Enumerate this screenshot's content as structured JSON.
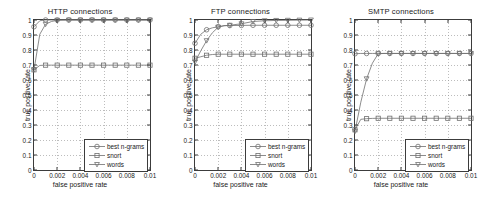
{
  "figure": {
    "width": 481,
    "height": 202,
    "background": "#ffffff",
    "axis_color": "#3c3c3c",
    "grid_color": "#9a9a9a",
    "series_color": "#6e6e6e"
  },
  "common": {
    "xlabel": "false positive rate",
    "ylabel": "true positive rate",
    "xticks": [
      "0",
      "0.002",
      "0.004",
      "0.006",
      "0.008",
      "0.01"
    ],
    "xtick_values": [
      0,
      0.002,
      0.004,
      0.006,
      0.008,
      0.01
    ],
    "yticks": [
      "0",
      "0.1",
      "0.2",
      "0.3",
      "0.4",
      "0.5",
      "0.6",
      "0.7",
      "0.8",
      "0.9",
      "1"
    ],
    "ytick_values": [
      0,
      0.1,
      0.2,
      0.3,
      0.4,
      0.5,
      0.6,
      0.7,
      0.8,
      0.9,
      1
    ],
    "xlim": [
      0,
      0.01
    ],
    "ylim": [
      0,
      1
    ],
    "grid": true,
    "legend_position": "lower right",
    "legend_labels": [
      "best n-grams",
      "snort",
      "words"
    ],
    "legend_markers": [
      "circle",
      "square",
      "triangle-down"
    ]
  },
  "chart_data": [
    {
      "type": "line",
      "title": "HTTP connections",
      "xlabel": "false positive rate",
      "ylabel": "true positive rate",
      "xlim": [
        0,
        0.01
      ],
      "ylim": [
        0,
        1
      ],
      "grid": true,
      "x": [
        0,
        0.0005,
        0.001,
        0.0015,
        0.002,
        0.0025,
        0.003,
        0.004,
        0.005,
        0.006,
        0.007,
        0.008,
        0.009,
        0.01
      ],
      "series": [
        {
          "name": "best n-grams",
          "marker": "circle",
          "values": [
            0.955,
            0.995,
            1.0,
            1.0,
            1.0,
            1.0,
            1.0,
            1.0,
            1.0,
            1.0,
            1.0,
            1.0,
            1.0,
            1.0
          ]
        },
        {
          "name": "snort",
          "marker": "square",
          "values": [
            0.668,
            0.697,
            0.699,
            0.699,
            0.699,
            0.699,
            0.699,
            0.699,
            0.699,
            0.699,
            0.699,
            0.699,
            0.699,
            0.699
          ]
        },
        {
          "name": "words",
          "marker": "triangle-down",
          "values": [
            0.668,
            0.905,
            0.972,
            0.99,
            0.998,
            1.0,
            1.0,
            1.0,
            1.0,
            1.0,
            1.0,
            1.0,
            1.0,
            1.0
          ]
        }
      ]
    },
    {
      "type": "line",
      "title": "FTP connections",
      "xlabel": "false positive rate",
      "ylabel": "true positive rate",
      "xlim": [
        0,
        0.01
      ],
      "ylim": [
        0,
        1
      ],
      "grid": true,
      "x": [
        0,
        0.0005,
        0.001,
        0.0015,
        0.002,
        0.0025,
        0.003,
        0.004,
        0.005,
        0.006,
        0.007,
        0.008,
        0.009,
        0.01
      ],
      "series": [
        {
          "name": "best n-grams",
          "marker": "circle",
          "values": [
            0.845,
            0.905,
            0.935,
            0.948,
            0.955,
            0.962,
            0.963,
            0.964,
            0.965,
            0.965,
            0.965,
            0.965,
            0.965,
            0.965
          ]
        },
        {
          "name": "snort",
          "marker": "square",
          "values": [
            0.745,
            0.755,
            0.765,
            0.77,
            0.772,
            0.772,
            0.772,
            0.772,
            0.772,
            0.772,
            0.772,
            0.772,
            0.772,
            0.772
          ]
        },
        {
          "name": "words",
          "marker": "triangle-down",
          "values": [
            0.72,
            0.795,
            0.862,
            0.915,
            0.952,
            0.962,
            0.965,
            0.975,
            0.99,
            0.995,
            0.997,
            0.998,
            0.999,
            1.0
          ]
        }
      ]
    },
    {
      "type": "line",
      "title": "SMTP connections",
      "xlabel": "false positive rate",
      "ylabel": "true positive rate",
      "xlim": [
        0,
        0.01
      ],
      "ylim": [
        0,
        1
      ],
      "grid": true,
      "x": [
        0,
        0.0005,
        0.001,
        0.0015,
        0.002,
        0.0025,
        0.003,
        0.004,
        0.005,
        0.006,
        0.007,
        0.008,
        0.009,
        0.01
      ],
      "series": [
        {
          "name": "best n-grams",
          "marker": "circle",
          "values": [
            0.775,
            0.777,
            0.777,
            0.777,
            0.777,
            0.777,
            0.777,
            0.777,
            0.777,
            0.777,
            0.777,
            0.777,
            0.777,
            0.777
          ]
        },
        {
          "name": "snort",
          "marker": "square",
          "values": [
            0.268,
            0.338,
            0.342,
            0.344,
            0.345,
            0.345,
            0.345,
            0.345,
            0.345,
            0.345,
            0.345,
            0.345,
            0.345,
            0.345
          ]
        },
        {
          "name": "words",
          "marker": "triangle-down",
          "values": [
            0.258,
            0.452,
            0.608,
            0.712,
            0.775,
            0.777,
            0.777,
            0.777,
            0.777,
            0.777,
            0.777,
            0.777,
            0.777,
            0.777
          ]
        }
      ]
    }
  ]
}
